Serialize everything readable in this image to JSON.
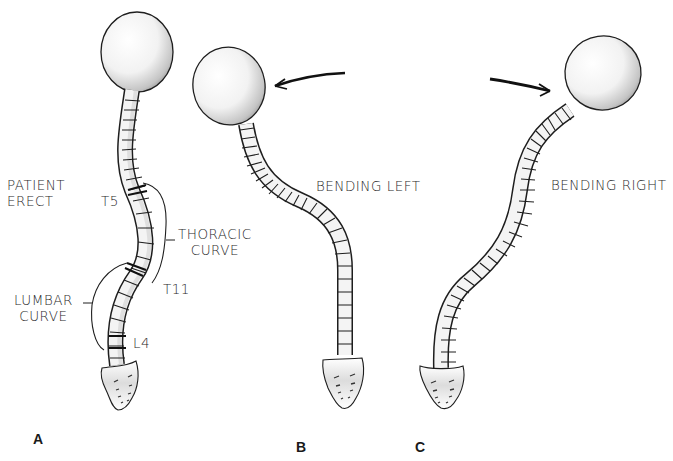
{
  "figure": {
    "panels": [
      {
        "id": "A",
        "label": "A",
        "title_line1": "PATIENT",
        "title_line2": "ERECT",
        "annotations": {
          "t5": "T5",
          "t11": "T11",
          "l4": "L4",
          "thoracic_line1": "THORACIC",
          "thoracic_line2": "CURVE",
          "lumbar_line1": "LUMBAR",
          "lumbar_line2": "CURVE"
        }
      },
      {
        "id": "B",
        "label": "B",
        "title": "BENDING LEFT",
        "arrow_direction": "left"
      },
      {
        "id": "C",
        "label": "C",
        "title": "BENDING RIGHT",
        "arrow_direction": "right"
      }
    ],
    "colors": {
      "ink": "#1e1e1e",
      "background": "#ffffff",
      "shade": "#9a9a9a"
    }
  }
}
